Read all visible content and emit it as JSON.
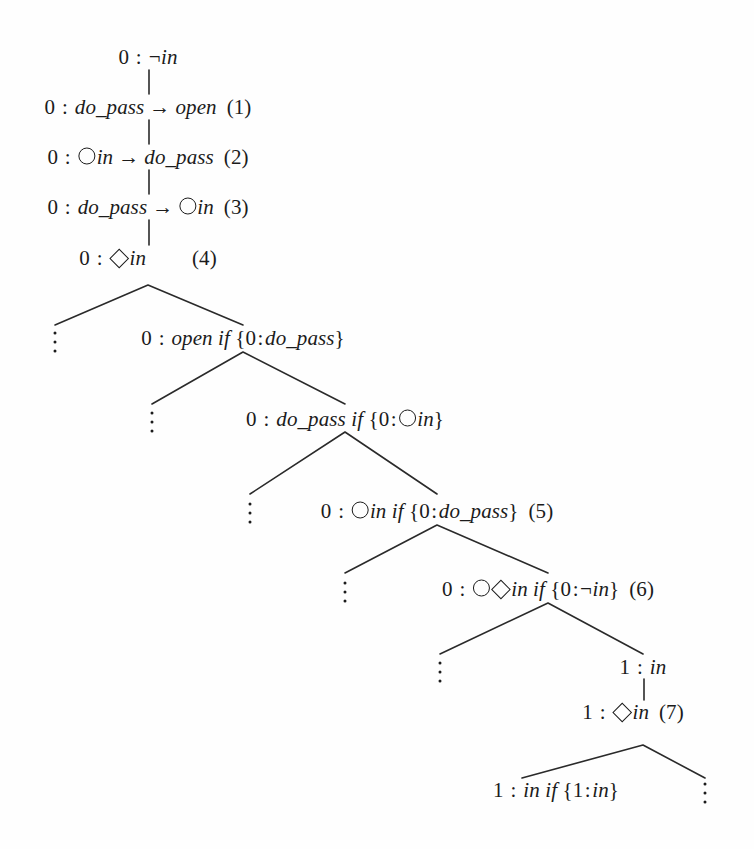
{
  "figure": {
    "kind": "proof-tableau-tree",
    "background": "#fefefe",
    "ink": "#1b1b1b",
    "width": 754,
    "height": 849
  },
  "nodes": [
    {
      "id": "n0",
      "world": "0",
      "formula_parts": [
        {
          "t": "neg",
          "v": "¬"
        },
        {
          "t": "it",
          "v": "in"
        }
      ],
      "label": "",
      "x": 148,
      "y": 57
    },
    {
      "id": "n1",
      "world": "0",
      "formula_parts": [
        {
          "t": "it",
          "v": "do_pass"
        },
        {
          "t": "arrow",
          "v": "→"
        },
        {
          "t": "it",
          "v": "open"
        }
      ],
      "label": "(1)",
      "x": 148,
      "y": 107
    },
    {
      "id": "n2",
      "world": "0",
      "formula_parts": [
        {
          "t": "next",
          "v": ""
        },
        {
          "t": "it",
          "v": "in"
        },
        {
          "t": "arrow",
          "v": "→"
        },
        {
          "t": "it",
          "v": "do_pass"
        }
      ],
      "label": "(2)",
      "x": 148,
      "y": 157
    },
    {
      "id": "n3",
      "world": "0",
      "formula_parts": [
        {
          "t": "it",
          "v": "do_pass"
        },
        {
          "t": "arrow",
          "v": "→"
        },
        {
          "t": "next",
          "v": ""
        },
        {
          "t": "it",
          "v": "in"
        }
      ],
      "label": "(3)",
      "x": 148,
      "y": 207
    },
    {
      "id": "n4",
      "world": "0",
      "formula_parts": [
        {
          "t": "dia",
          "v": ""
        },
        {
          "t": "it",
          "v": "in"
        }
      ],
      "label": "(4)",
      "label_gap": true,
      "x": 148,
      "y": 258
    },
    {
      "id": "n5",
      "world": "0",
      "formula_parts": [
        {
          "t": "it",
          "v": "open"
        },
        {
          "t": "sp",
          "v": " "
        },
        {
          "t": "it",
          "v": "if"
        },
        {
          "t": "sp",
          "v": " "
        },
        {
          "t": "brace",
          "v": "{"
        },
        {
          "t": "num",
          "v": "0"
        },
        {
          "t": "colon",
          "v": ":"
        },
        {
          "t": "it",
          "v": "do_pass"
        },
        {
          "t": "brace",
          "v": "}"
        }
      ],
      "label": "",
      "x": 243,
      "y": 338
    },
    {
      "id": "n6",
      "world": "0",
      "formula_parts": [
        {
          "t": "it",
          "v": "do_pass"
        },
        {
          "t": "sp",
          "v": " "
        },
        {
          "t": "it",
          "v": "if"
        },
        {
          "t": "sp",
          "v": " "
        },
        {
          "t": "brace",
          "v": "{"
        },
        {
          "t": "num",
          "v": "0"
        },
        {
          "t": "colon",
          "v": ":"
        },
        {
          "t": "next",
          "v": ""
        },
        {
          "t": "it",
          "v": "in"
        },
        {
          "t": "brace",
          "v": "}"
        }
      ],
      "label": "",
      "x": 345,
      "y": 419
    },
    {
      "id": "n7",
      "world": "0",
      "formula_parts": [
        {
          "t": "next",
          "v": ""
        },
        {
          "t": "it",
          "v": "in"
        },
        {
          "t": "sp",
          "v": " "
        },
        {
          "t": "it",
          "v": "if"
        },
        {
          "t": "sp",
          "v": " "
        },
        {
          "t": "brace",
          "v": "{"
        },
        {
          "t": "num",
          "v": "0"
        },
        {
          "t": "colon",
          "v": ":"
        },
        {
          "t": "it",
          "v": "do_pass"
        },
        {
          "t": "brace",
          "v": "}"
        }
      ],
      "label": "(5)",
      "x": 437,
      "y": 511
    },
    {
      "id": "n8",
      "world": "0",
      "formula_parts": [
        {
          "t": "next",
          "v": ""
        },
        {
          "t": "dia",
          "v": ""
        },
        {
          "t": "it",
          "v": "in"
        },
        {
          "t": "sp",
          "v": " "
        },
        {
          "t": "it",
          "v": "if"
        },
        {
          "t": "sp",
          "v": " "
        },
        {
          "t": "brace",
          "v": "{"
        },
        {
          "t": "num",
          "v": "0"
        },
        {
          "t": "colon",
          "v": ":"
        },
        {
          "t": "neg",
          "v": "¬"
        },
        {
          "t": "it",
          "v": "in"
        },
        {
          "t": "brace",
          "v": "}"
        }
      ],
      "label": "(6)",
      "x": 548,
      "y": 589
    },
    {
      "id": "n9",
      "world": "1",
      "formula_parts": [
        {
          "t": "it",
          "v": "in"
        }
      ],
      "label": "",
      "x": 643,
      "y": 667
    },
    {
      "id": "n10",
      "world": "1",
      "formula_parts": [
        {
          "t": "dia",
          "v": ""
        },
        {
          "t": "it",
          "v": "in"
        }
      ],
      "label": "(7)",
      "x": 633,
      "y": 712
    },
    {
      "id": "n11",
      "world": "1",
      "formula_parts": [
        {
          "t": "it",
          "v": "in"
        },
        {
          "t": "sp",
          "v": " "
        },
        {
          "t": "it",
          "v": "if"
        },
        {
          "t": "sp",
          "v": " "
        },
        {
          "t": "brace",
          "v": "{"
        },
        {
          "t": "num",
          "v": "1"
        },
        {
          "t": "colon",
          "v": ":"
        },
        {
          "t": "it",
          "v": "in"
        },
        {
          "t": "brace",
          "v": "}"
        }
      ],
      "label": "",
      "x": 556,
      "y": 790
    }
  ],
  "vertical_edges": [
    {
      "x": 149,
      "y1": 70,
      "y2": 94
    },
    {
      "x": 149,
      "y1": 120,
      "y2": 144
    },
    {
      "x": 149,
      "y1": 170,
      "y2": 194
    },
    {
      "x": 149,
      "y1": 220,
      "y2": 245
    },
    {
      "x": 644,
      "y1": 679,
      "y2": 700
    }
  ],
  "branch_edges": [
    {
      "apex_x": 148,
      "apex_y": 285,
      "lx": 55,
      "ly": 325,
      "rx": 243,
      "ry": 325
    },
    {
      "apex_x": 243,
      "apex_y": 352,
      "lx": 152,
      "ly": 404,
      "rx": 345,
      "ry": 404
    },
    {
      "apex_x": 345,
      "apex_y": 432,
      "lx": 250,
      "ly": 494,
      "rx": 437,
      "ry": 494
    },
    {
      "apex_x": 437,
      "apex_y": 525,
      "lx": 345,
      "ly": 573,
      "rx": 548,
      "ry": 573
    },
    {
      "apex_x": 548,
      "apex_y": 603,
      "lx": 440,
      "ly": 654,
      "rx": 643,
      "ry": 654
    },
    {
      "apex_x": 643,
      "apex_y": 745,
      "lx": 522,
      "ly": 778,
      "rx": 705,
      "ry": 778
    }
  ],
  "ellipses": [
    {
      "x": 55,
      "y": 342
    },
    {
      "x": 152,
      "y": 422
    },
    {
      "x": 250,
      "y": 513
    },
    {
      "x": 345,
      "y": 592
    },
    {
      "x": 440,
      "y": 672
    },
    {
      "x": 705,
      "y": 793
    }
  ],
  "glyphs": {
    "next_operator": "open-circle",
    "eventually_operator": "open-diamond",
    "negation": "¬",
    "implication": "→",
    "world_separator": ":",
    "set_open": "{",
    "set_close": "}"
  }
}
